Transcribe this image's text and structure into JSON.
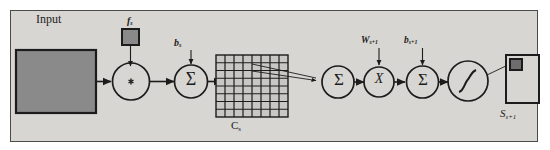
{
  "figure": {
    "kind": "cnn-layer-dataflow-diagram",
    "background_color": "#d8d6d2",
    "ink_color": "#1c1c1c",
    "fill_gray": "#8a8a8a"
  },
  "labels": {
    "input": "Input",
    "filter": "f",
    "filter_sub": "s",
    "bias": "b",
    "bias_sub": "s",
    "feature_map": "C",
    "feature_map_sub": "s",
    "weight_next": "W",
    "weight_next_sub": "s+1",
    "bias_next": "b",
    "bias_next_sub": "s+1",
    "output": "S",
    "output_sub": "s+1"
  },
  "operators": {
    "convolution": "*",
    "sum_1": "Σ",
    "sum_2": "Σ",
    "sum_3": "Σ",
    "multiply": "X",
    "activation": "sigmoid"
  },
  "nodes": [
    {
      "name": "input-image",
      "type": "rectangle",
      "label": "Input"
    },
    {
      "name": "filter-kernel",
      "type": "small-square",
      "label": "f_s"
    },
    {
      "name": "convolution-op",
      "type": "circle",
      "label": "*"
    },
    {
      "name": "sum-bias-op",
      "type": "circle",
      "label": "Σ"
    },
    {
      "name": "feature-map-grid",
      "type": "grid",
      "label": "C_s",
      "rows": 8,
      "cols": 8
    },
    {
      "name": "pool-sum-op",
      "type": "circle",
      "label": "Σ"
    },
    {
      "name": "weight-multiply-op",
      "type": "circle",
      "label": "X"
    },
    {
      "name": "bias-add-op",
      "type": "circle",
      "label": "Σ"
    },
    {
      "name": "activation-op",
      "type": "circle",
      "label": "sigmoid"
    },
    {
      "name": "output-map",
      "type": "square",
      "label": "S_s+1"
    }
  ],
  "grid": {
    "rows": 8,
    "cols": 8,
    "cell_fill": "#c9c7c3",
    "line_color": "#1c1c1c"
  }
}
